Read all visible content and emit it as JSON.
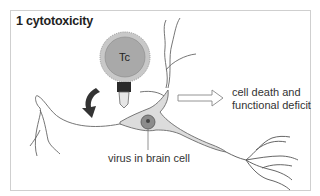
{
  "diagram": {
    "title": "1 cytotoxicity",
    "tcell_label": "Tc",
    "labels": {
      "infected_cell": "virus in brain cell",
      "outcome_line1": "cell death and",
      "outcome_line2": "functional deficit"
    },
    "colors": {
      "tcell_fill": "#a9a9a9",
      "tcell_ring": "#c8c8c8",
      "neuron_fill": "#dcdcdc",
      "neuron_stroke": "#6a6a6a",
      "nucleus_fill": "#8c8c8c",
      "arrow_dark": "#333333",
      "frame": "#cfcfcf"
    }
  }
}
